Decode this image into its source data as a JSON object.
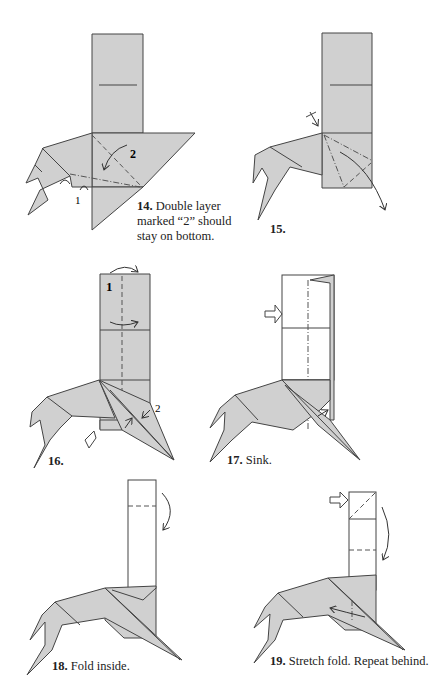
{
  "page": {
    "steps": [
      {
        "number": "14.",
        "caption_line1": "Double layer",
        "caption_line2": "marked “2” should",
        "caption_line3": "stay on bottom.",
        "labels": [
          "1",
          "2"
        ]
      },
      {
        "number": "15.",
        "caption": ""
      },
      {
        "number": "16.",
        "caption": "",
        "labels": [
          "1",
          "2"
        ]
      },
      {
        "number": "17.",
        "caption": "Sink."
      },
      {
        "number": "18.",
        "caption": "Fold inside."
      },
      {
        "number": "19.",
        "caption": "Stretch fold. Repeat behind."
      }
    ]
  },
  "colors": {
    "paper_fill": "#d0d0d0",
    "line": "#444444",
    "background": "#ffffff"
  }
}
